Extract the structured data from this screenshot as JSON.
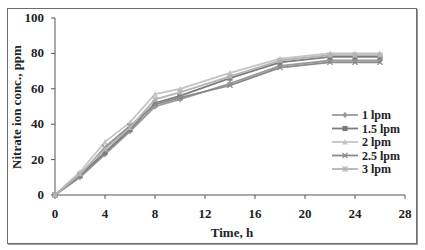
{
  "chart_data": {
    "type": "line",
    "title": "",
    "xlabel": "Time, h",
    "ylabel": "Nitrate ion conc., ppm",
    "xlim": [
      0,
      28
    ],
    "ylim": [
      0,
      100
    ],
    "xticks": [
      0,
      4,
      8,
      12,
      16,
      20,
      24,
      28
    ],
    "yticks": [
      0,
      20,
      40,
      60,
      80,
      100
    ],
    "grid": false,
    "legend_position": "right-center inside",
    "x": [
      0,
      2,
      4,
      6,
      8,
      10,
      14,
      18,
      22,
      24,
      26
    ],
    "series": [
      {
        "name": "1 lpm",
        "marker": "diamond",
        "color": "#9a9a9a",
        "values": [
          0,
          10,
          23,
          36,
          50,
          54,
          63,
          73,
          76,
          76,
          76
        ]
      },
      {
        "name": "1.5 lpm",
        "marker": "square",
        "color": "#7c7c7c",
        "values": [
          0,
          11,
          24,
          37,
          52,
          56,
          66,
          75,
          78,
          78,
          78
        ]
      },
      {
        "name": "2 lpm",
        "marker": "triangle",
        "color": "#c4c4c4",
        "values": [
          0,
          13,
          30,
          41,
          57,
          60,
          69,
          77,
          80,
          80,
          80
        ]
      },
      {
        "name": "2.5 lpm",
        "marker": "x",
        "color": "#8a8a8a",
        "values": [
          0,
          11,
          27,
          39,
          51,
          55,
          62,
          72,
          75,
          75,
          75
        ]
      },
      {
        "name": "3 lpm",
        "marker": "asterisk",
        "color": "#b4b4b4",
        "values": [
          0,
          12,
          26,
          38,
          54,
          58,
          67,
          76,
          79,
          79,
          79
        ]
      }
    ]
  },
  "legend": {
    "items": [
      "1 lpm",
      "1.5 lpm",
      "2 lpm",
      "2.5 lpm",
      "3 lpm"
    ]
  },
  "axes": {
    "xlabel": "Time, h",
    "ylabel": "Nitrate ion conc., ppm"
  }
}
